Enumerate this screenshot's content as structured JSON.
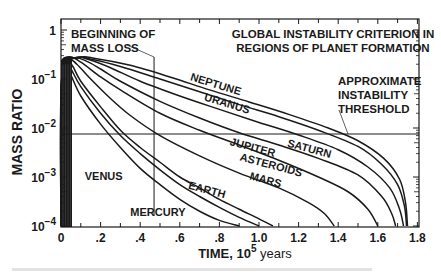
{
  "chart_data": {
    "type": "line",
    "title_lines": [
      "GLOBAL INSTABILITY CRITERION IN",
      "REGIONS OF PLANET FORMATION"
    ],
    "xlabel": "TIME, 10^5 years",
    "xlabel_parts": {
      "prefix": "TIME, 10",
      "sup": "5",
      "suffix": " years"
    },
    "ylabel": "MASS RATIO",
    "xlim": [
      0,
      1.8
    ],
    "ylim": [
      0.0001,
      1
    ],
    "yscale": "log",
    "x_ticks": [
      {
        "v": 0,
        "label": "0"
      },
      {
        "v": 0.2,
        "label": ".2"
      },
      {
        "v": 0.4,
        "label": ".4"
      },
      {
        "v": 0.6,
        "label": ".6"
      },
      {
        "v": 0.8,
        "label": ".8"
      },
      {
        "v": 1.0,
        "label": "1.0"
      },
      {
        "v": 1.2,
        "label": "1.2"
      },
      {
        "v": 1.4,
        "label": "1.4"
      },
      {
        "v": 1.6,
        "label": "1.6"
      },
      {
        "v": 1.8,
        "label": "1.8"
      }
    ],
    "y_ticks": [
      {
        "exp": 0,
        "base": "1",
        "sup": ""
      },
      {
        "exp": -1,
        "base": "10",
        "sup": "−1"
      },
      {
        "exp": -2,
        "base": "10",
        "sup": "−2"
      },
      {
        "exp": -3,
        "base": "10",
        "sup": "−3"
      },
      {
        "exp": -4,
        "base": "10",
        "sup": "−4"
      }
    ],
    "grid": false,
    "annotations": {
      "beginning_mass_loss": {
        "lines": [
          "BEGINNING OF",
          "MASS LOSS"
        ],
        "x": 0.47
      },
      "threshold": {
        "lines": [
          "APPROXIMATE",
          "INSTABILITY",
          "THRESHOLD"
        ],
        "y": 0.007
      }
    },
    "series": [
      {
        "name": "MERCURY",
        "points": [
          [
            0.02,
            0.2
          ],
          [
            0.05,
            0.12
          ],
          [
            0.1,
            0.045
          ],
          [
            0.2,
            0.012
          ],
          [
            0.3,
            0.004
          ],
          [
            0.4,
            0.0015
          ],
          [
            0.5,
            0.0007
          ],
          [
            0.6,
            0.00035
          ],
          [
            0.7,
            0.0002
          ],
          [
            0.8,
            0.00013
          ],
          [
            0.9,
            0.0001
          ]
        ]
      },
      {
        "name": "VENUS",
        "points": [
          [
            0.02,
            0.22
          ],
          [
            0.05,
            0.16
          ],
          [
            0.1,
            0.07
          ],
          [
            0.2,
            0.02
          ],
          [
            0.3,
            0.007
          ],
          [
            0.4,
            0.003
          ],
          [
            0.5,
            0.0014
          ],
          [
            0.6,
            0.0007
          ],
          [
            0.7,
            0.0004
          ],
          [
            0.8,
            0.00024
          ],
          [
            0.9,
            0.00015
          ],
          [
            1.0,
            0.0001
          ]
        ]
      },
      {
        "name": "EARTH",
        "points": [
          [
            0.03,
            0.24
          ],
          [
            0.06,
            0.18
          ],
          [
            0.1,
            0.09
          ],
          [
            0.2,
            0.027
          ],
          [
            0.3,
            0.009
          ],
          [
            0.4,
            0.004
          ],
          [
            0.5,
            0.002
          ],
          [
            0.6,
            0.001
          ],
          [
            0.7,
            0.0006
          ],
          [
            0.8,
            0.00035
          ],
          [
            0.9,
            0.00022
          ],
          [
            1.0,
            0.00014
          ],
          [
            1.07,
            0.0001
          ]
        ]
      },
      {
        "name": "MARS",
        "points": [
          [
            0.04,
            0.25
          ],
          [
            0.08,
            0.2
          ],
          [
            0.15,
            0.1
          ],
          [
            0.25,
            0.04
          ],
          [
            0.35,
            0.018
          ],
          [
            0.5,
            0.007
          ],
          [
            0.7,
            0.0027
          ],
          [
            0.9,
            0.0012
          ],
          [
            1.1,
            0.0006
          ],
          [
            1.25,
            0.0003
          ],
          [
            1.33,
            0.00018
          ],
          [
            1.38,
            0.0001
          ]
        ]
      },
      {
        "name": "ASTEROIDS",
        "points": [
          [
            0.05,
            0.26
          ],
          [
            0.1,
            0.22
          ],
          [
            0.2,
            0.11
          ],
          [
            0.3,
            0.06
          ],
          [
            0.5,
            0.02
          ],
          [
            0.7,
            0.009
          ],
          [
            0.9,
            0.0045
          ],
          [
            1.1,
            0.0022
          ],
          [
            1.3,
            0.001
          ],
          [
            1.45,
            0.0005
          ],
          [
            1.55,
            0.00022
          ],
          [
            1.6,
            0.0001
          ]
        ]
      },
      {
        "name": "JUPITER",
        "points": [
          [
            0.06,
            0.26
          ],
          [
            0.12,
            0.24
          ],
          [
            0.2,
            0.16
          ],
          [
            0.3,
            0.09
          ],
          [
            0.5,
            0.035
          ],
          [
            0.7,
            0.016
          ],
          [
            0.9,
            0.008
          ],
          [
            1.1,
            0.0045
          ],
          [
            1.3,
            0.0024
          ],
          [
            1.5,
            0.0011
          ],
          [
            1.62,
            0.0004
          ],
          [
            1.67,
            0.00018
          ],
          [
            1.69,
            0.0001
          ]
        ]
      },
      {
        "name": "SATURN",
        "points": [
          [
            0.07,
            0.27
          ],
          [
            0.14,
            0.25
          ],
          [
            0.25,
            0.17
          ],
          [
            0.4,
            0.09
          ],
          [
            0.6,
            0.045
          ],
          [
            0.8,
            0.024
          ],
          [
            1.0,
            0.013
          ],
          [
            1.2,
            0.0072
          ],
          [
            1.4,
            0.0036
          ],
          [
            1.55,
            0.0016
          ],
          [
            1.66,
            0.0006
          ],
          [
            1.71,
            0.00022
          ],
          [
            1.73,
            0.0001
          ]
        ]
      },
      {
        "name": "URANUS",
        "points": [
          [
            0.08,
            0.27
          ],
          [
            0.16,
            0.25
          ],
          [
            0.3,
            0.18
          ],
          [
            0.5,
            0.1
          ],
          [
            0.7,
            0.055
          ],
          [
            0.9,
            0.03
          ],
          [
            1.1,
            0.017
          ],
          [
            1.3,
            0.009
          ],
          [
            1.5,
            0.0042
          ],
          [
            1.62,
            0.0018
          ],
          [
            1.7,
            0.0007
          ],
          [
            1.735,
            0.00025
          ],
          [
            1.745,
            0.0001
          ]
        ]
      },
      {
        "name": "NEPTUNE",
        "points": [
          [
            0.09,
            0.27
          ],
          [
            0.18,
            0.26
          ],
          [
            0.35,
            0.19
          ],
          [
            0.55,
            0.11
          ],
          [
            0.75,
            0.06
          ],
          [
            0.95,
            0.034
          ],
          [
            1.15,
            0.019
          ],
          [
            1.35,
            0.01
          ],
          [
            1.5,
            0.0055
          ],
          [
            1.63,
            0.0024
          ],
          [
            1.71,
            0.0009
          ],
          [
            1.74,
            0.0003
          ],
          [
            1.75,
            0.0001
          ]
        ]
      }
    ],
    "series_labels": [
      {
        "name": "NEPTUNE",
        "x": 0.65,
        "y": 0.095,
        "angle": 17
      },
      {
        "name": "URANUS",
        "x": 0.72,
        "y": 0.037,
        "angle": 17
      },
      {
        "name": "SATURN",
        "x": 1.14,
        "y": 0.0042,
        "angle": 15
      },
      {
        "name": "JUPITER",
        "x": 0.85,
        "y": 0.0045,
        "angle": 15
      },
      {
        "name": "ASTEROIDS",
        "x": 0.9,
        "y": 0.0022,
        "angle": 15
      },
      {
        "name": "MARS",
        "x": 0.95,
        "y": 0.0009,
        "angle": 15
      },
      {
        "name": "EARTH",
        "x": 0.64,
        "y": 0.00058,
        "angle": 15
      },
      {
        "name": "VENUS",
        "x": 0.12,
        "y": 0.00085,
        "angle": 0
      },
      {
        "name": "MERCURY",
        "x": 0.35,
        "y": 0.00016,
        "angle": 0
      }
    ]
  },
  "caption_text": ""
}
